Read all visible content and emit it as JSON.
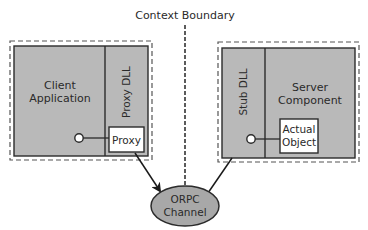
{
  "diagram": {
    "boundary_label": "Context Boundary",
    "client": {
      "label_line1": "Client",
      "label_line2": "Application",
      "dll_label": "Proxy DLL",
      "proxy_label": "Proxy"
    },
    "server": {
      "label_line1": "Server",
      "label_line2": "Component",
      "dll_label": "Stub DLL",
      "object_line1": "Actual",
      "object_line2": "Object"
    },
    "channel": {
      "label_line1": "ORPC",
      "label_line2": "Channel"
    },
    "colors": {
      "box_fill": "#b9b9b9",
      "ellipse_fill": "#a8a8a8",
      "stroke": "#2b2b2b",
      "dashed": "#555555",
      "white": "#ffffff"
    }
  }
}
